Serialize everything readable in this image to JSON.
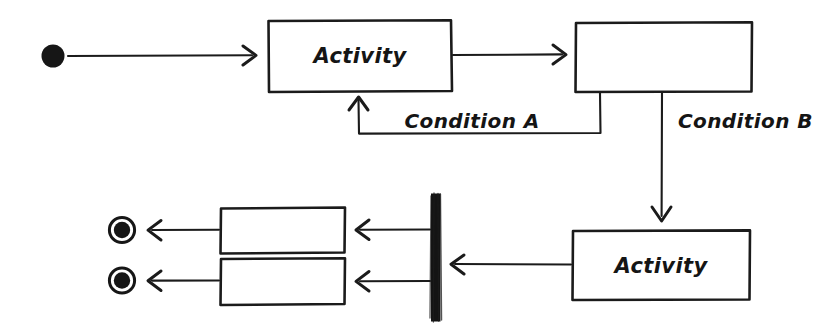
{
  "diagram": {
    "kind": "uml-activity-diagram",
    "style": "hand-drawn-sketch",
    "background_color": "#ffffff",
    "ink_color": "#1b1b1b",
    "canvas": {
      "width": 830,
      "height": 335
    },
    "nodes": {
      "initial": {
        "type": "initial-node",
        "label": "",
        "cx": 53,
        "cy": 56,
        "r": 11
      },
      "activity_1": {
        "type": "action",
        "label": "Activity",
        "x": 268,
        "y": 20,
        "w": 184,
        "h": 72,
        "text_x": 360,
        "text_y": 63
      },
      "decision_box": {
        "type": "action",
        "label": "",
        "x": 575,
        "y": 22,
        "w": 177,
        "h": 70
      },
      "activity_2": {
        "type": "action",
        "label": "Activity",
        "x": 572,
        "y": 230,
        "w": 178,
        "h": 70,
        "text_x": 661,
        "text_y": 273
      },
      "fork": {
        "type": "fork-join-bar",
        "label": "",
        "x": 431,
        "y": 193,
        "w": 9,
        "h": 129
      },
      "action_upper": {
        "type": "action",
        "label": "",
        "x": 220,
        "y": 207,
        "w": 125,
        "h": 46
      },
      "action_lower": {
        "type": "action",
        "label": "",
        "x": 220,
        "y": 258,
        "w": 125,
        "h": 47
      },
      "final_upper": {
        "type": "final-node",
        "label": "",
        "cx": 122,
        "cy": 230,
        "r_outer": 13,
        "r_inner": 8
      },
      "final_lower": {
        "type": "final-node",
        "label": "",
        "cx": 122,
        "cy": 280,
        "r_outer": 13,
        "r_inner": 8
      }
    },
    "edges": [
      {
        "id": "e1",
        "from": "initial",
        "to": "activity_1",
        "label": "",
        "direction": "right"
      },
      {
        "id": "e2",
        "from": "activity_1",
        "to": "decision_box",
        "label": "",
        "direction": "right"
      },
      {
        "id": "e3",
        "from": "decision_box",
        "to": "activity_1",
        "label": "Condition A",
        "direction": "up",
        "label_x": 472,
        "label_y": 128
      },
      {
        "id": "e4",
        "from": "decision_box",
        "to": "activity_2",
        "label": "Condition B",
        "direction": "down",
        "label_x": 678,
        "label_y": 128
      },
      {
        "id": "e5",
        "from": "activity_2",
        "to": "fork",
        "label": "",
        "direction": "left"
      },
      {
        "id": "e6",
        "from": "fork",
        "to": "action_upper",
        "label": "",
        "direction": "left"
      },
      {
        "id": "e7",
        "from": "fork",
        "to": "action_lower",
        "label": "",
        "direction": "left"
      },
      {
        "id": "e8",
        "from": "action_upper",
        "to": "final_upper",
        "label": "",
        "direction": "left"
      },
      {
        "id": "e9",
        "from": "action_lower",
        "to": "final_lower",
        "label": "",
        "direction": "left"
      }
    ],
    "labels": {
      "activity_1": "Activity",
      "activity_2": "Activity",
      "condition_a": "Condition A",
      "condition_b": "Condition B"
    }
  }
}
